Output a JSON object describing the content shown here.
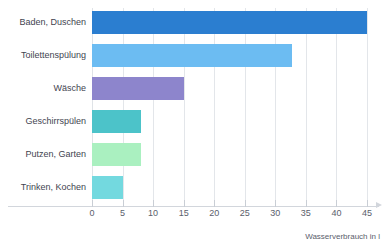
{
  "chart_data": {
    "type": "bar",
    "orientation": "horizontal",
    "title": "",
    "xlabel": "Wasserverbrauch in l",
    "ylabel": "",
    "xlim": [
      0,
      45
    ],
    "xticks": [
      0,
      5,
      10,
      15,
      20,
      25,
      30,
      35,
      40,
      45
    ],
    "grid": true,
    "legend": false,
    "categories": [
      "Baden, Duschen",
      "Toilettenspülung",
      "Wäsche",
      "Geschirrspülen",
      "Putzen, Garten",
      "Trinken, Kochen"
    ],
    "values": [
      45,
      32.7,
      15,
      8,
      8,
      5
    ],
    "colors": [
      "#2b7ed0",
      "#6cbcf2",
      "#8d85cc",
      "#4cc3c9",
      "#aaf0c0",
      "#73d9df"
    ]
  },
  "axis": {
    "title": "Wasserverbrauch in l",
    "tick_labels": [
      "0",
      "5",
      "10",
      "15",
      "20",
      "25",
      "30",
      "35",
      "40",
      "45"
    ]
  },
  "style": {
    "grid_color": "#e3e6ea",
    "axis_color": "#d2d6dc",
    "text_color": "#3f4450",
    "background": "#ffffff"
  }
}
